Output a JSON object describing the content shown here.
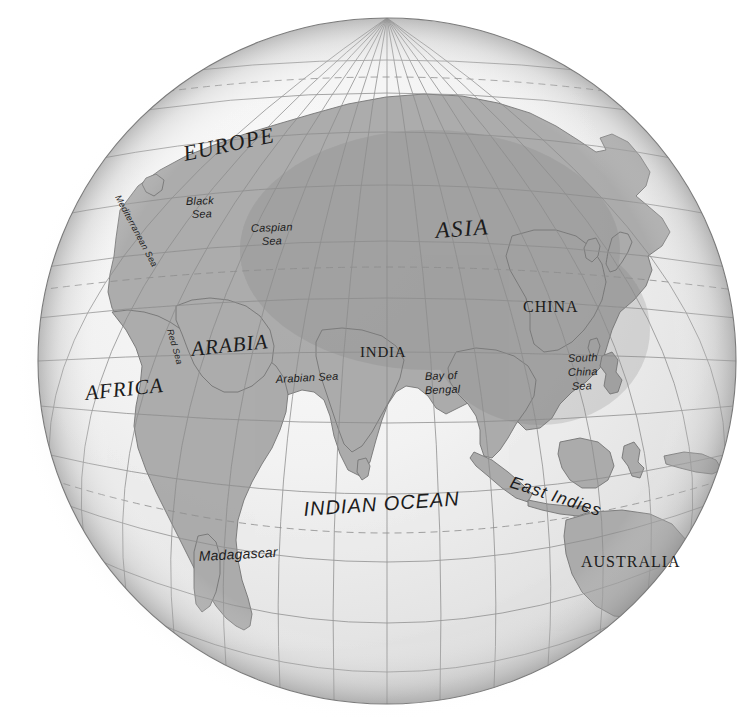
{
  "page": {
    "clipped_header_text": "",
    "background_color": "#ffffff"
  },
  "globe": {
    "center_x": 387,
    "center_y": 361,
    "radius_x": 349,
    "radius_y": 343,
    "ocean_color": "#ededed",
    "land_color": "#a8a8a8",
    "land_outline_color": "#6f6f6f",
    "graticule_color": "#8d8d8d",
    "tropic_line_color": "#8d8d8d",
    "tropic_line_style": "dashed",
    "outline_color": "#7a7a7a",
    "shadow_color": "#c9c9c9",
    "graticule_spacing_degrees": 15,
    "center_longitude": 75,
    "center_latitude": 18,
    "projection": "orthographic"
  },
  "labels": {
    "continents": [
      {
        "name": "europe-label",
        "text": "EUROPE",
        "x": 185,
        "y": 161,
        "size": 22,
        "style": "italic-serif",
        "rotate": -12,
        "letter_spacing": 1.2
      },
      {
        "name": "asia-label",
        "text": "ASIA",
        "x": 436,
        "y": 238,
        "size": 23,
        "style": "italic-serif",
        "rotate": -4,
        "letter_spacing": 1.6
      },
      {
        "name": "africa-label",
        "text": "AFRICA",
        "x": 86,
        "y": 400,
        "size": 21,
        "style": "italic-serif",
        "rotate": -6,
        "letter_spacing": 1.0
      },
      {
        "name": "arabia-label",
        "text": "ARABIA",
        "x": 192,
        "y": 356,
        "size": 21,
        "style": "italic-serif",
        "rotate": -6,
        "letter_spacing": 1.0
      }
    ],
    "countries": [
      {
        "name": "china-label",
        "text": "CHINA",
        "x": 523,
        "y": 312,
        "size": 16,
        "style": "serif",
        "rotate": 0,
        "letter_spacing": 1.0
      },
      {
        "name": "india-label",
        "text": "INDIA",
        "x": 360,
        "y": 357,
        "size": 15,
        "style": "serif",
        "rotate": 0,
        "letter_spacing": 0.8
      },
      {
        "name": "australia-label",
        "text": "AUSTRALIA",
        "x": 581,
        "y": 567,
        "size": 16,
        "style": "serif",
        "rotate": 0,
        "letter_spacing": 1.0
      }
    ],
    "oceans": [
      {
        "name": "indian-ocean-label",
        "text": "INDIAN OCEAN",
        "x": 304,
        "y": 516,
        "size": 20,
        "style": "italic-sans",
        "rotate": -4,
        "letter_spacing": 1.0
      }
    ],
    "seas": [
      {
        "name": "mediterranean-sea-label",
        "text": "Mediterranean Sea",
        "x": 115,
        "y": 197,
        "size": 9,
        "style": "italic-sans",
        "rotate": 62,
        "letter_spacing": 0.2
      },
      {
        "name": "black-sea-label-line1",
        "text": "Black",
        "x": 186,
        "y": 205,
        "size": 11,
        "style": "italic-sans",
        "rotate": -2,
        "letter_spacing": 0.2
      },
      {
        "name": "black-sea-label-line2",
        "text": "Sea",
        "x": 192,
        "y": 218,
        "size": 11,
        "style": "italic-sans",
        "rotate": -2,
        "letter_spacing": 0.2
      },
      {
        "name": "caspian-sea-label-line1",
        "text": "Caspian",
        "x": 251,
        "y": 232,
        "size": 11,
        "style": "italic-sans",
        "rotate": -2,
        "letter_spacing": 0.2
      },
      {
        "name": "caspian-sea-label-line2",
        "text": "Sea",
        "x": 262,
        "y": 245,
        "size": 11,
        "style": "italic-sans",
        "rotate": -2,
        "letter_spacing": 0.2
      },
      {
        "name": "red-sea-label",
        "text": "Red Sea",
        "x": 167,
        "y": 330,
        "size": 9,
        "style": "italic-sans",
        "rotate": 74,
        "letter_spacing": 0.2
      },
      {
        "name": "arabian-sea-label",
        "text": "Arabian Sea",
        "x": 276,
        "y": 383,
        "size": 11,
        "style": "italic-sans",
        "rotate": -3,
        "letter_spacing": 0.2
      },
      {
        "name": "bay-of-bengal-label-line1",
        "text": "Bay of",
        "x": 425,
        "y": 380,
        "size": 11,
        "style": "italic-sans",
        "rotate": -2,
        "letter_spacing": 0.2
      },
      {
        "name": "bay-of-bengal-label-line2",
        "text": "Bengal",
        "x": 425,
        "y": 394,
        "size": 11,
        "style": "italic-sans",
        "rotate": -2,
        "letter_spacing": 0.2
      },
      {
        "name": "south-china-sea-label-line1",
        "text": "South",
        "x": 568,
        "y": 362,
        "size": 11,
        "style": "italic-sans",
        "rotate": -2,
        "letter_spacing": 0.2
      },
      {
        "name": "south-china-sea-label-line2",
        "text": "China",
        "x": 568,
        "y": 376,
        "size": 11,
        "style": "italic-sans",
        "rotate": -2,
        "letter_spacing": 0.2
      },
      {
        "name": "south-china-sea-label-line3",
        "text": "Sea",
        "x": 572,
        "y": 390,
        "size": 11,
        "style": "italic-sans",
        "rotate": -2,
        "letter_spacing": 0.2
      }
    ],
    "regions": [
      {
        "name": "east-indies-label",
        "text": "East Indies",
        "x": 509,
        "y": 487,
        "size": 17,
        "style": "italic-sans",
        "rotate": 18,
        "letter_spacing": 1.0
      }
    ],
    "islands": [
      {
        "name": "madagascar-label",
        "text": "Madagascar",
        "x": 199,
        "y": 561,
        "size": 14,
        "style": "italic-sans",
        "rotate": -3,
        "letter_spacing": 0.2
      }
    ]
  }
}
